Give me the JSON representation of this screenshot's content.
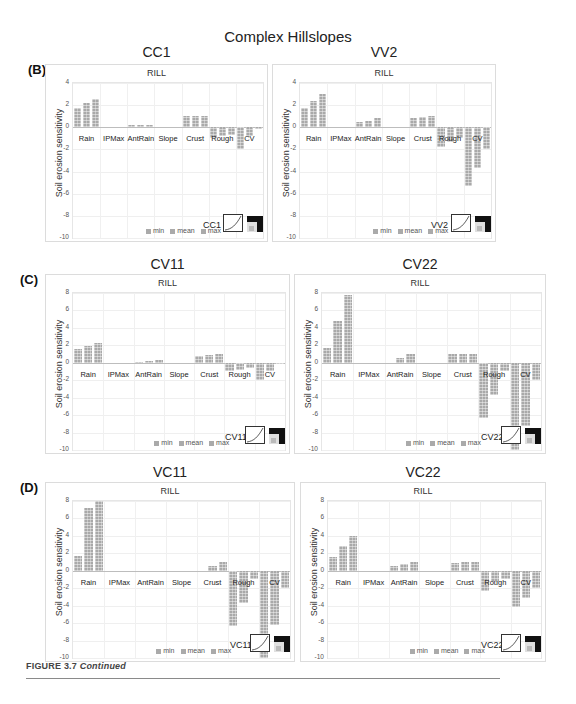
{
  "figure": {
    "main_title": "Complex Hillslopes",
    "caption_label": "FIGURE 3.7",
    "caption_text": "Continued"
  },
  "panels": [
    {
      "letter": "(B)",
      "title": "CC1",
      "subtitle": "RILL",
      "code": "CC1"
    },
    {
      "letter": "",
      "title": "VV2",
      "subtitle": "RILL",
      "code": "VV2"
    },
    {
      "letter": "(C)",
      "title": "CV11",
      "subtitle": "RILL",
      "code": "CV11"
    },
    {
      "letter": "",
      "title": "CV22",
      "subtitle": "RILL",
      "code": "CV22"
    },
    {
      "letter": "(D)",
      "title": "VC11",
      "subtitle": "RILL",
      "code": "VC11"
    },
    {
      "letter": "",
      "title": "VC22",
      "subtitle": "RILL",
      "code": "VC22"
    }
  ],
  "common": {
    "ylabel": "Soil erosion sensitivity",
    "legend": [
      "min",
      "mean",
      "max"
    ],
    "categories": [
      "Rain",
      "IPMax",
      "AntRain",
      "Slope",
      "Crust",
      "Rough",
      "CV"
    ]
  },
  "chart_data": [
    {
      "type": "bar",
      "title": "CC1",
      "subtitle": "RILL",
      "panel": "(B)",
      "xlabel": "",
      "ylabel": "Soil erosion sensitivity",
      "ylim": [
        -10,
        4
      ],
      "yticks": [
        4,
        2,
        0,
        -2,
        -4,
        -6,
        -8,
        -10
      ],
      "categories": [
        "Rain",
        "IPMax",
        "AntRain",
        "Slope",
        "Crust",
        "Rough",
        "CV"
      ],
      "series": [
        {
          "name": "min",
          "values": [
            1.7,
            0,
            0.2,
            0,
            1.0,
            -1.0,
            -2.0
          ]
        },
        {
          "name": "mean",
          "values": [
            2.2,
            0,
            0.2,
            0,
            1.0,
            -0.8,
            -0.8
          ]
        },
        {
          "name": "max",
          "values": [
            2.6,
            0,
            0.2,
            0,
            1.0,
            -0.7,
            -0.1
          ]
        }
      ],
      "legend_position": "bottom",
      "grid": true
    },
    {
      "type": "bar",
      "title": "VV2",
      "subtitle": "RILL",
      "panel": "(B)",
      "xlabel": "",
      "ylabel": "Soil erosion sensitivity",
      "ylim": [
        -10,
        4
      ],
      "yticks": [
        4,
        2,
        0,
        -2,
        -4,
        -6,
        -8,
        -10
      ],
      "categories": [
        "Rain",
        "IPMax",
        "AntRain",
        "Slope",
        "Crust",
        "Rough",
        "CV"
      ],
      "series": [
        {
          "name": "min",
          "values": [
            1.7,
            0,
            0.5,
            0,
            0.8,
            -1.8,
            -5.3
          ]
        },
        {
          "name": "mean",
          "values": [
            2.4,
            0,
            0.6,
            0,
            0.9,
            -1.3,
            -3.7
          ]
        },
        {
          "name": "max",
          "values": [
            3.0,
            0,
            0.8,
            0,
            1.0,
            -1.0,
            -2.0
          ]
        }
      ],
      "legend_position": "bottom",
      "grid": true
    },
    {
      "type": "bar",
      "title": "CV11",
      "subtitle": "RILL",
      "panel": "(C)",
      "xlabel": "",
      "ylabel": "Soil erosion sensitivity",
      "ylim": [
        -10,
        8
      ],
      "yticks": [
        8,
        6,
        4,
        2,
        0,
        -2,
        -4,
        -6,
        -8,
        -10
      ],
      "categories": [
        "Rain",
        "IPMax",
        "AntRain",
        "Slope",
        "Crust",
        "Rough",
        "CV"
      ],
      "series": [
        {
          "name": "min",
          "values": [
            1.6,
            0,
            0.1,
            0,
            0.8,
            -1.0,
            -2.0
          ]
        },
        {
          "name": "mean",
          "values": [
            1.9,
            0,
            0.2,
            0,
            0.9,
            -0.8,
            -1.0
          ]
        },
        {
          "name": "max",
          "values": [
            2.3,
            0,
            0.3,
            0,
            1.0,
            -0.6,
            -0.1
          ]
        }
      ],
      "legend_position": "bottom",
      "grid": true
    },
    {
      "type": "bar",
      "title": "CV22",
      "subtitle": "RILL",
      "panel": "(C)",
      "xlabel": "",
      "ylabel": "Soil erosion sensitivity",
      "ylim": [
        -10,
        8
      ],
      "yticks": [
        8,
        6,
        4,
        2,
        0,
        -2,
        -4,
        -6,
        -8,
        -10
      ],
      "categories": [
        "Rain",
        "IPMax",
        "AntRain",
        "Slope",
        "Crust",
        "Rough",
        "CV"
      ],
      "series": [
        {
          "name": "min",
          "values": [
            1.7,
            0,
            0.0,
            0,
            1.0,
            -6.3,
            -10.0
          ]
        },
        {
          "name": "mean",
          "values": [
            4.8,
            0,
            0.5,
            0,
            1.0,
            -3.7,
            -7.3
          ]
        },
        {
          "name": "max",
          "values": [
            7.8,
            0,
            1.0,
            0,
            1.0,
            -1.0,
            -2.0
          ]
        }
      ],
      "legend_position": "bottom",
      "grid": true
    },
    {
      "type": "bar",
      "title": "VC11",
      "subtitle": "RILL",
      "panel": "(D)",
      "xlabel": "",
      "ylabel": "Soil erosion sensitivity",
      "ylim": [
        -10,
        8
      ],
      "yticks": [
        8,
        6,
        4,
        2,
        0,
        -2,
        -4,
        -6,
        -8,
        -10
      ],
      "categories": [
        "Rain",
        "IPMax",
        "AntRain",
        "Slope",
        "Crust",
        "Rough",
        "CV"
      ],
      "series": [
        {
          "name": "min",
          "values": [
            1.7,
            0,
            0,
            0,
            0.0,
            -6.3,
            -10.0
          ]
        },
        {
          "name": "mean",
          "values": [
            7.2,
            0,
            0,
            0,
            0.5,
            -3.7,
            -6.2
          ]
        },
        {
          "name": "max",
          "values": [
            8.0,
            0,
            0,
            0,
            1.0,
            -1.0,
            -2.0
          ]
        }
      ],
      "legend_position": "bottom",
      "grid": true
    },
    {
      "type": "bar",
      "title": "VC22",
      "subtitle": "RILL",
      "panel": "(D)",
      "xlabel": "",
      "ylabel": "Soil erosion sensitivity",
      "ylim": [
        -10,
        8
      ],
      "yticks": [
        8,
        6,
        4,
        2,
        0,
        -2,
        -4,
        -6,
        -8,
        -10
      ],
      "categories": [
        "Rain",
        "IPMax",
        "AntRain",
        "Slope",
        "Crust",
        "Rough",
        "CV"
      ],
      "series": [
        {
          "name": "min",
          "values": [
            1.6,
            0,
            0.6,
            0,
            0.9,
            -2.3,
            -4.2
          ]
        },
        {
          "name": "mean",
          "values": [
            2.8,
            0,
            0.8,
            0,
            1.0,
            -1.3,
            -3.1
          ]
        },
        {
          "name": "max",
          "values": [
            4.0,
            0,
            1.0,
            0,
            1.0,
            -1.0,
            -2.0
          ]
        }
      ],
      "legend_position": "bottom",
      "grid": true
    }
  ]
}
